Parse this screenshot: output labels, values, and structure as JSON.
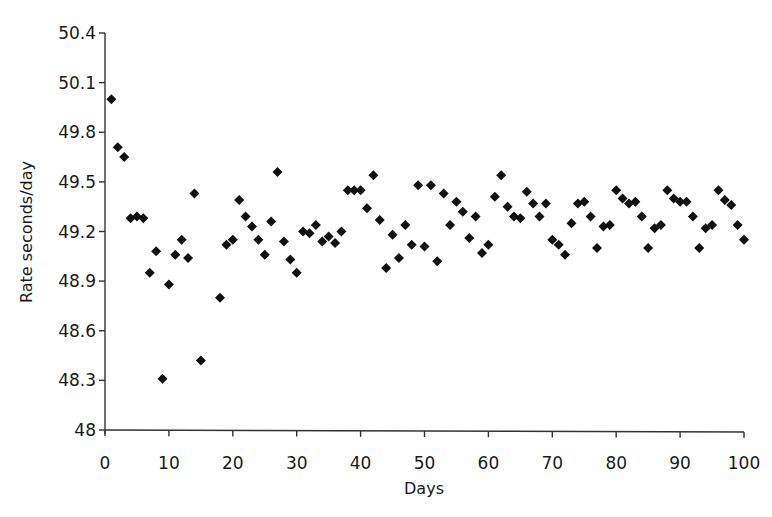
{
  "chart_data": {
    "type": "scatter",
    "title": "",
    "xlabel": "Days",
    "ylabel": "Rate seconds/day",
    "xlim": [
      0,
      100
    ],
    "ylim": [
      48,
      50.4
    ],
    "x_ticks": [
      0,
      10,
      20,
      30,
      40,
      50,
      60,
      70,
      80,
      90,
      100
    ],
    "x_tick_labels": [
      "0",
      "10",
      "20",
      "30",
      "40",
      "50",
      "60",
      "70",
      "80",
      "90",
      "100"
    ],
    "y_ticks": [
      48,
      48.3,
      48.6,
      48.9,
      49.2,
      49.5,
      49.8,
      50.1,
      50.4
    ],
    "y_tick_labels": [
      "48",
      "48.3",
      "48.6",
      "48.9",
      "49.2",
      "49.5",
      "49.8",
      "50.1",
      "50.4"
    ],
    "grid": false,
    "legend": null,
    "marker": "diamond",
    "marker_color": "#111111",
    "series": [
      {
        "name": "Rate",
        "x": [
          1,
          2,
          3,
          4,
          5,
          6,
          7,
          8,
          9,
          10,
          11,
          12,
          13,
          14,
          15,
          18,
          19,
          20,
          21,
          22,
          23,
          24,
          25,
          26,
          27,
          28,
          29,
          30,
          31,
          32,
          33,
          34,
          35,
          36,
          37,
          38,
          39,
          40,
          41,
          42,
          43,
          44,
          45,
          46,
          47,
          48,
          49,
          50,
          51,
          52,
          53,
          54,
          55,
          56,
          57,
          58,
          59,
          60,
          61,
          62,
          63,
          64,
          65,
          66,
          67,
          68,
          69,
          70,
          71,
          72,
          73,
          74,
          75,
          76,
          77,
          78,
          79,
          80,
          81,
          82,
          83,
          84,
          85,
          86,
          87,
          88,
          89,
          90,
          91,
          92,
          93,
          94,
          95,
          96,
          97,
          98,
          99,
          100
        ],
        "y": [
          50.0,
          49.71,
          49.65,
          49.28,
          49.29,
          49.28,
          48.95,
          49.08,
          48.31,
          48.88,
          49.06,
          49.15,
          49.04,
          49.43,
          48.42,
          48.8,
          49.12,
          49.15,
          49.39,
          49.29,
          49.23,
          49.15,
          49.06,
          49.26,
          49.56,
          49.14,
          49.03,
          48.95,
          49.2,
          49.19,
          49.24,
          49.14,
          49.17,
          49.13,
          49.2,
          49.45,
          49.45,
          49.45,
          49.34,
          49.54,
          49.27,
          48.98,
          49.18,
          49.04,
          49.24,
          49.12,
          49.48,
          49.11,
          49.48,
          49.02,
          49.43,
          49.24,
          49.38,
          49.32,
          49.16,
          49.29,
          49.07,
          49.12,
          49.41,
          49.54,
          49.35,
          49.29,
          49.28,
          49.44,
          49.37,
          49.29,
          49.37,
          49.15,
          49.12,
          49.06,
          49.25,
          49.37,
          49.38,
          49.29,
          49.1,
          49.23,
          49.24,
          49.45,
          49.4,
          49.37,
          49.38,
          49.29,
          49.1,
          49.22,
          49.24,
          49.45,
          49.4,
          49.38,
          49.38,
          49.29,
          49.1,
          49.22,
          49.24,
          49.45,
          49.39,
          49.36,
          49.24,
          49.15
        ]
      }
    ]
  }
}
